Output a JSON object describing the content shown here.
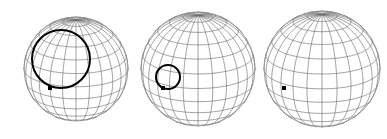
{
  "figure": {
    "width": 387,
    "height": 139,
    "background_color": "#ffffff",
    "grid_color": "#6e6e6e",
    "outline_color": "#8a8a8a",
    "overlay_color": "#000000",
    "marker_color": "#000000",
    "grid_step_degrees": 15,
    "projection": "orthographic"
  },
  "chart_data": {
    "type": "scatter",
    "xlabel": "",
    "ylabel": "",
    "panels": [
      {
        "index": 1,
        "name": "sphere-large-cap",
        "center_x": 76,
        "center_y": 69,
        "radius": 52,
        "view_latitude_deg": 20,
        "view_longitude_deg": 0,
        "grid_step_degrees": 15,
        "overlay_circle": {
          "present": true,
          "center_x": 61,
          "center_y": 59,
          "radius": 29,
          "stroke_width": 2.0,
          "color": "#000000"
        },
        "marker": {
          "present": true,
          "x": 50,
          "y": 88,
          "size": 4,
          "color": "#000000"
        }
      },
      {
        "index": 2,
        "name": "sphere-small-cap",
        "center_x": 198,
        "center_y": 69,
        "radius": 57,
        "view_latitude_deg": 20,
        "view_longitude_deg": 0,
        "grid_step_degrees": 15,
        "overlay_circle": {
          "present": true,
          "center_x": 168,
          "center_y": 77,
          "radius": 12,
          "stroke_width": 2.0,
          "color": "#000000"
        },
        "marker": {
          "present": true,
          "x": 163,
          "y": 88,
          "size": 4,
          "color": "#000000"
        }
      },
      {
        "index": 3,
        "name": "sphere-point-only",
        "center_x": 322,
        "center_y": 69,
        "radius": 58,
        "view_latitude_deg": 20,
        "view_longitude_deg": 0,
        "grid_step_degrees": 15,
        "overlay_circle": {
          "present": false,
          "center_x": 0,
          "center_y": 0,
          "radius": 0,
          "stroke_width": 0,
          "color": "#000000"
        },
        "marker": {
          "present": true,
          "x": 284,
          "y": 88,
          "size": 4,
          "color": "#000000"
        }
      }
    ]
  }
}
